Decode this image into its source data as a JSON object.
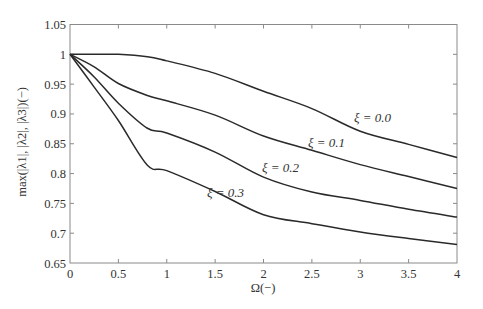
{
  "chart_data": {
    "type": "line",
    "title": "",
    "xlabel": "Ω(−)",
    "ylabel": "max(|λ1|, |λ2|, |λ3|)(−)",
    "xlim": [
      0,
      4
    ],
    "ylim": [
      0.65,
      1.05
    ],
    "xticks": [
      0,
      0.5,
      1,
      1.5,
      2,
      2.5,
      3,
      3.5,
      4
    ],
    "xtick_labels": [
      "0",
      "0.5",
      "1",
      "1.5",
      "2",
      "2.5",
      "3",
      "3.5",
      "4"
    ],
    "yticks": [
      0.65,
      0.7,
      0.75,
      0.8,
      0.85,
      0.9,
      0.95,
      1.0,
      1.05
    ],
    "ytick_labels": [
      "0.65",
      "0.7",
      "0.75",
      "0.8",
      "0.85",
      "0.9",
      "0.95",
      "1",
      "1.05"
    ],
    "grid": false,
    "legend": "inline labels on curves",
    "x": [
      0,
      0.25,
      0.5,
      0.8,
      1.0,
      1.5,
      2.0,
      2.5,
      3.0,
      3.5,
      4.0
    ],
    "series": [
      {
        "name": "ξ = 0.0",
        "values": [
          1.0,
          1.0,
          1.0,
          0.996,
          0.989,
          0.968,
          0.938,
          0.909,
          0.871,
          0.849,
          0.827
        ],
        "label_pos": [
          354,
          122
        ]
      },
      {
        "name": "ξ = 0.1",
        "values": [
          1.0,
          0.979,
          0.951,
          0.931,
          0.922,
          0.898,
          0.863,
          0.839,
          0.815,
          0.795,
          0.775
        ],
        "label_pos": [
          308,
          147
        ]
      },
      {
        "name": "ξ = 0.2",
        "values": [
          1.0,
          0.962,
          0.918,
          0.876,
          0.868,
          0.836,
          0.794,
          0.769,
          0.755,
          0.74,
          0.727
        ],
        "label_pos": [
          262,
          172
        ]
      },
      {
        "name": "ξ = 0.3",
        "values": [
          1.0,
          0.945,
          0.889,
          0.814,
          0.805,
          0.77,
          0.731,
          0.716,
          0.702,
          0.691,
          0.681
        ],
        "label_pos": [
          207,
          197
        ]
      }
    ],
    "colors": {
      "line": "#2a2a2a",
      "axis": "#8a8a8a",
      "text": "#333333"
    }
  }
}
